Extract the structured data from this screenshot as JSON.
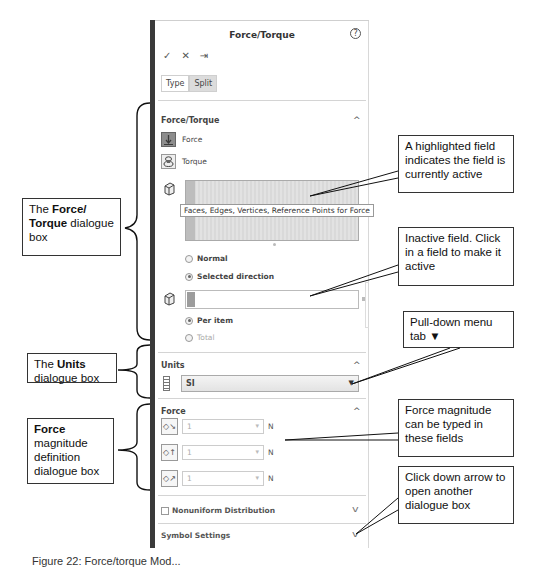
{
  "panel": {
    "title": "Force/Torque",
    "help_icon": "?",
    "actions": {
      "ok": "✓",
      "cancel": "✕",
      "pin": "⇥"
    },
    "tabs": [
      {
        "label": "Type",
        "active": false
      },
      {
        "label": "Split",
        "active": true
      }
    ],
    "sections": {
      "force_torque": {
        "header": "Force/Torque",
        "collapse": "^",
        "options": [
          {
            "label": "Force",
            "icon": "force-arrow-icon",
            "selected": true
          },
          {
            "label": "Torque",
            "icon": "torque-icon",
            "selected": false
          }
        ],
        "selection_tooltip": "Faces, Edges, Vertices, Reference Points for Force",
        "direction_options": [
          {
            "label": "Normal",
            "checked": false
          },
          {
            "label": "Selected direction",
            "checked": true
          }
        ],
        "distribution_options": [
          {
            "label": "Per item",
            "checked": true,
            "enabled": true
          },
          {
            "label": "Total",
            "checked": false,
            "enabled": false
          }
        ]
      },
      "units": {
        "header": "Units",
        "collapse": "^",
        "selected": "SI",
        "caret": "▼"
      },
      "force": {
        "header": "Force",
        "collapse": "^",
        "rows": [
          {
            "value": "1",
            "unit": "N",
            "icon": "force-x-icon",
            "spin": "▾"
          },
          {
            "value": "1",
            "unit": "N",
            "icon": "force-y-icon",
            "spin": "▾"
          },
          {
            "value": "1",
            "unit": "N",
            "icon": "force-z-icon",
            "spin": "▾"
          }
        ]
      },
      "nonuniform": {
        "label": "Nonuniform Distribution",
        "checked": false,
        "chevron": "v"
      },
      "symbol_settings": {
        "label": "Symbol Settings",
        "chevron": "v"
      }
    }
  },
  "callouts": {
    "force_torque_box": {
      "pre": "The ",
      "bold": "Force/ Torque",
      "post": " dialogue box"
    },
    "units_box": {
      "pre": "The ",
      "bold": "Units",
      "post": " dialogue box"
    },
    "force_box": {
      "bold": "Force",
      "post": " magnitude definition dialogue box"
    },
    "active_field": "A highlighted field indicates the field is currently active",
    "inactive_field": "Inactive field. Click in a field to make it active",
    "pulldown": "Pull-down menu tab ▼",
    "force_magnitude": "Force magnitude can be typed in these fields",
    "down_arrow": "Click down arrow to open another dialogue box"
  },
  "caption": "Figure 22: Force/torque Mod..."
}
